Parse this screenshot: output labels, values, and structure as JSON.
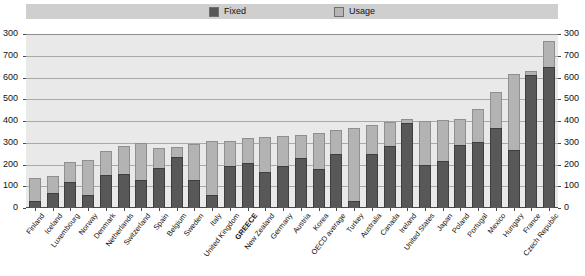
{
  "legend": {
    "items": [
      {
        "label": "Fixed",
        "color": "#575757",
        "icon": "square-swatch-icon"
      },
      {
        "label": "Usage",
        "color": "#b6b6b6",
        "icon": "square-swatch-icon"
      }
    ]
  },
  "footnote": "",
  "chart_data": {
    "type": "bar",
    "subtype": "stacked",
    "title": "",
    "subtitle": "",
    "xlabel": "",
    "ylabel": "",
    "ylim": [
      0,
      800
    ],
    "grid": true,
    "legend_position": "top",
    "y_axis_left_ticks": [
      "300",
      "700",
      "600",
      "500",
      "400",
      "300",
      "200",
      "100",
      "0"
    ],
    "y_axis_right_ticks": [
      "300",
      "700",
      "600",
      "500",
      "400",
      "300",
      "200",
      "100",
      "0"
    ],
    "tick_values": [
      800,
      700,
      600,
      500,
      400,
      300,
      200,
      100,
      0
    ],
    "highlight_category": "GREECE",
    "categories": [
      "Finland",
      "Iceland",
      "Luxembourg",
      "Norway",
      "Denmark",
      "Netherlands",
      "Switzerland",
      "Spain",
      "Belgium",
      "Sweden",
      "Italy",
      "United Kingdom",
      "GREECE",
      "New Zealand",
      "Germany",
      "Austria",
      "Korea",
      "OECD average",
      "Turkey",
      "Australia",
      "Canada",
      "Ireland",
      "United States",
      "Japan",
      "Poland",
      "Portugal",
      "Mexico",
      "Hungary",
      "France",
      "Czech Republic"
    ],
    "series": [
      {
        "name": "Fixed",
        "color": "#575757",
        "values": [
          30,
          70,
          120,
          60,
          150,
          155,
          130,
          185,
          235,
          130,
          60,
          195,
          205,
          165,
          195,
          230,
          180,
          250,
          30,
          250,
          285,
          390,
          200,
          215,
          290,
          305,
          370,
          265,
          610,
          650
        ]
      },
      {
        "name": "Usage",
        "color": "#b6b6b6",
        "values": [
          110,
          75,
          90,
          160,
          110,
          130,
          170,
          90,
          45,
          165,
          250,
          115,
          115,
          160,
          135,
          105,
          165,
          110,
          340,
          130,
          110,
          20,
          200,
          190,
          120,
          150,
          165,
          350,
          20,
          120
        ]
      }
    ],
    "totals": [
      140,
      145,
      210,
      220,
      260,
      285,
      300,
      275,
      280,
      295,
      310,
      310,
      320,
      325,
      330,
      335,
      345,
      360,
      370,
      380,
      395,
      410,
      400,
      405,
      410,
      455,
      535,
      615,
      630,
      770
    ]
  }
}
